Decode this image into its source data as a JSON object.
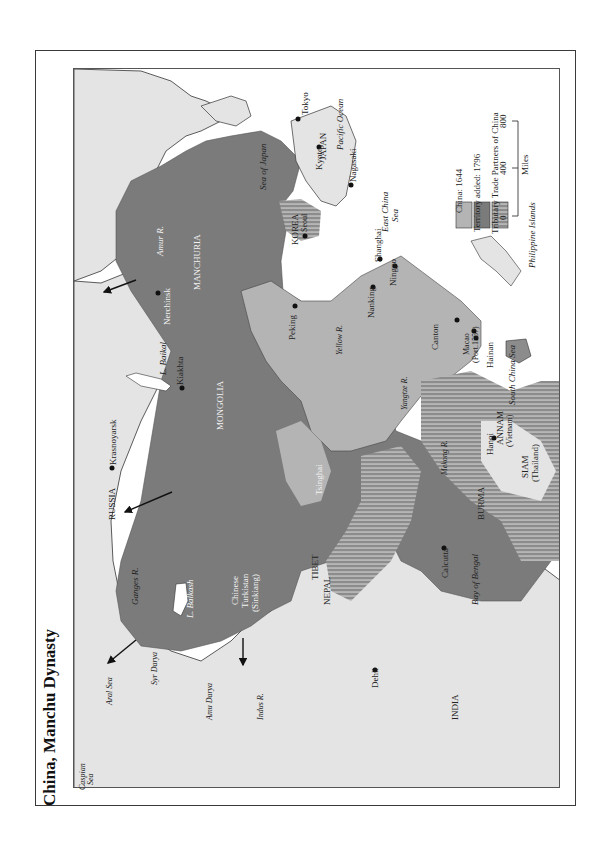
{
  "title": "China, Manchu Dynasty",
  "colors": {
    "china_1644": "#b4b4b4",
    "territory_1796": "#7b7b7b",
    "tributary": "#8c8c8c",
    "tributary_stripe": "#c4c4c4",
    "other_land": "#e4e4e4",
    "water": "#ffffff",
    "border": "#333333"
  },
  "legend": {
    "items": [
      {
        "label": "China: 1644",
        "swatch": "china_1644"
      },
      {
        "label": "Territory added: 1796",
        "swatch": "territory_1796"
      },
      {
        "label": "Tributary Trade Partners of China",
        "swatch": "tributary"
      }
    ],
    "scale": {
      "ticks": [
        "0",
        "400",
        "800"
      ],
      "unit": "Miles"
    }
  },
  "regions": {
    "russia": "RUSSIA",
    "mongolia": "MONGOLIA",
    "manchuria": "MANCHURIA",
    "korea": "KOREA",
    "japan": "JAPAN",
    "tsinghai": "Tsinghai",
    "turkistan": [
      "Chinese",
      "Turkistan",
      "(Sinkiang)"
    ],
    "tibet": "TIBET",
    "nepal": "NEPAL",
    "india": "INDIA",
    "burma": "BURMA",
    "siam": [
      "SIAM",
      "(Thailand)"
    ],
    "annam": [
      "ANNAM",
      "(Vietnam)"
    ],
    "hainan": "Hainan",
    "philippines": "Philippine Islands"
  },
  "cities": {
    "tokyo": "Tokyo",
    "kyoto": "Kyoto",
    "nagasaki": "Nagasaki",
    "seoul": "Seoul",
    "peking": "Peking",
    "nanking": "Nanking",
    "shanghai": "Shanghai",
    "ningpo": "Ningpo",
    "canton": "Canton",
    "macao": [
      "Macao",
      "(Port.1557)"
    ],
    "hanoi": "Hanoi",
    "calcutta": "Calcutta",
    "dehli": "Dehli",
    "nerchinsk": "Nerchinsk",
    "kiakhta": "Kiakhta",
    "krasnoyarsk": "Krasnoyarsk"
  },
  "water": {
    "sea_of_japan": "Sea of Japan",
    "pacific": "Pacific Ocean",
    "east_china_sea": [
      "East China",
      "Sea"
    ],
    "south_china_sea": "South China Sea",
    "bay_of_bengal": "Bay of Bengal",
    "aral_sea": "Aral Sea",
    "caspian_sea": [
      "Caspian",
      "Sea"
    ],
    "l_baikal": "L. Baikal",
    "l_balkash": "L. Balkash"
  },
  "rivers": {
    "amur": "Amur R.",
    "yellow": "Yellow R.",
    "yangtze": "Yangtze R.",
    "mekong": "Mekong R.",
    "ganges": "Ganges R.",
    "indus": "Indus R.",
    "syr_darya": "Syr Darya",
    "amu_darya": "Amu Darya"
  }
}
